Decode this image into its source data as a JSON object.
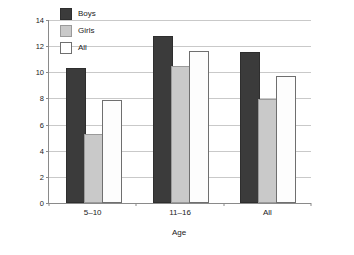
{
  "chart_data": {
    "type": "bar",
    "title": "",
    "xlabel": "Age",
    "ylabel": "Percentage of children with a mental disorder",
    "categories": [
      "5–10",
      "11–16",
      "All"
    ],
    "series": [
      {
        "name": "Boys",
        "values": [
          10.2,
          12.6,
          11.4
        ],
        "color": "#3b3b3b"
      },
      {
        "name": "Girls",
        "values": [
          5.1,
          10.3,
          7.8
        ],
        "color": "#c9c9c9"
      },
      {
        "name": "All",
        "values": [
          7.7,
          11.5,
          9.6
        ],
        "color": "#ffffff"
      }
    ],
    "ylim": [
      0,
      14
    ],
    "yticks": [
      0,
      2,
      4,
      6,
      8,
      10,
      12,
      14
    ],
    "ytick_labels": [
      "0",
      "2",
      "4",
      "6",
      "8",
      "10",
      "12",
      "14"
    ],
    "grid": true,
    "legend_position": "upper-left-inside",
    "legend": [
      "Boys",
      "Girls",
      "All"
    ]
  },
  "axes": {
    "y_title": "Percentage of children with a mental disorder",
    "x_title": "Age"
  }
}
